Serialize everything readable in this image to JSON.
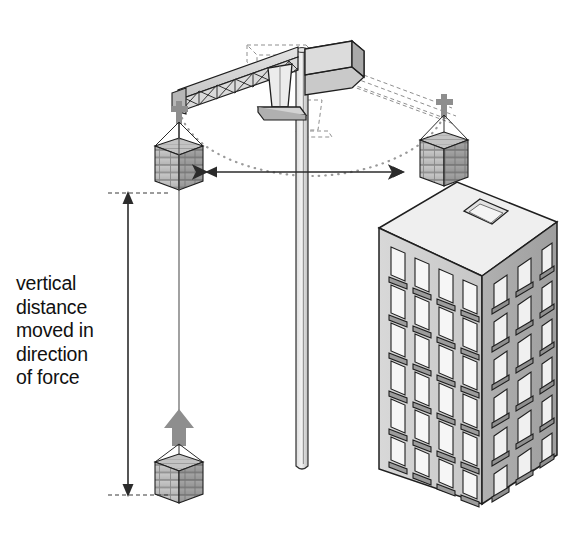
{
  "diagram": {
    "caption_label": "vertical\ndistance\nmoved in\ndirection\nof force",
    "caption_lines": [
      "vertical",
      "distance",
      "moved in",
      "direction",
      "of force"
    ],
    "background_color": "#ffffff",
    "ink_color": "#1a1a1a",
    "fill_light": "#e8e8e8",
    "fill_mid": "#cfcfcf",
    "fill_dark": "#a8a8a8",
    "arrow_color": "#8c8c8c",
    "dimension_color": "#3a3a3a"
  },
  "labels": {
    "vertical_dimension": "vertical distance moved in direction of force",
    "horizontal_dimension": "horizontal swing distance"
  },
  "parts": {
    "mast": "crane-mast",
    "jib": "lattice-jib",
    "counterweight": "counterweight-block",
    "operator_cab": "operator-cab",
    "hoist_cables": "hoist-cables",
    "hook_block": "hook-block",
    "load_top_left": "brick-load-raised-left",
    "load_top_right": "brick-load-placed-on-roof",
    "load_bottom": "brick-load-at-ground",
    "building": "apartment-building",
    "roof_hatch": "roof-skylight",
    "swing_path": "dotted-swing-arc",
    "ghost_jib": "dashed-ghost-jib"
  },
  "building": {
    "floors": 6,
    "front_windows_per_floor": 4,
    "side_windows_per_floor": 3,
    "roof_features": [
      "skylight",
      "brick-load"
    ]
  },
  "dimensions": {
    "vertical_arrow_top_y": 193,
    "vertical_arrow_bottom_y": 495,
    "horizontal_arrow_left_x": 205,
    "horizontal_arrow_right_x": 405,
    "horizontal_arrow_y": 172
  }
}
